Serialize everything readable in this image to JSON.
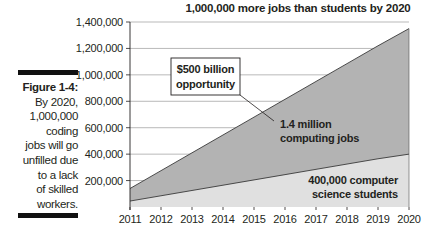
{
  "figure": {
    "number_label": "Figure 1-4",
    "caption_lines": [
      "By 2020,",
      "1,000,000",
      "coding",
      "jobs will go",
      "unfilled due",
      "to a lack",
      "of skilled",
      "workers."
    ]
  },
  "chart_data": {
    "type": "area",
    "title": "1,000,000 more jobs than students by 2020",
    "xlabel": "",
    "ylabel": "",
    "categories": [
      "2011",
      "2012",
      "2013",
      "2014",
      "2015",
      "2016",
      "2017",
      "2018",
      "2019",
      "2020"
    ],
    "series": [
      {
        "name": "Computing jobs",
        "values": [
          140000,
          275000,
          410000,
          545000,
          680000,
          815000,
          950000,
          1085000,
          1220000,
          1350000
        ],
        "color": "#b3b3b3"
      },
      {
        "name": "Computer science students",
        "values": [
          45000,
          85000,
          125000,
          165000,
          205000,
          245000,
          285000,
          325000,
          365000,
          400000
        ],
        "color": "#e0e0e0"
      }
    ],
    "yticks": [
      "200,000",
      "400,000",
      "600,000",
      "800,000",
      "1,000,000",
      "1,200,000",
      "1,400,000"
    ],
    "ylim": [
      0,
      1400000
    ],
    "grid": "horizontal",
    "annotations": [
      {
        "text_lines": [
          "$500 billion",
          "opportunity"
        ],
        "boxed": true
      },
      {
        "text_lines": [
          "1.4 million",
          "computing jobs"
        ],
        "boxed": false
      },
      {
        "text_lines": [
          "400,000 computer",
          "science students"
        ],
        "boxed": false
      }
    ]
  }
}
